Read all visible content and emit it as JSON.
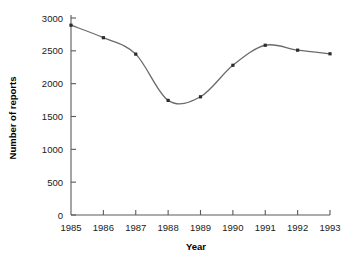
{
  "chart_data": {
    "type": "line",
    "title": "",
    "xlabel": "Year",
    "ylabel": "Number of reports",
    "categories": [
      "1985",
      "1986",
      "1987",
      "1988",
      "1989",
      "1990",
      "1991",
      "1992",
      "1993"
    ],
    "x": [
      1985,
      1986,
      1987,
      1988,
      1989,
      1990,
      1991,
      1992,
      1993
    ],
    "values": [
      2890,
      2700,
      2450,
      1745,
      1800,
      2280,
      2585,
      2510,
      2455
    ],
    "series": [
      {
        "name": "Number of reports",
        "values": [
          2890,
          2700,
          2450,
          1745,
          1800,
          2280,
          2585,
          2510,
          2455
        ]
      }
    ],
    "xlim": [
      1985,
      1993
    ],
    "ylim": [
      0,
      3000
    ],
    "ytick_labels": [
      "0",
      "500",
      "1000",
      "1500",
      "2000",
      "2500",
      "3000"
    ],
    "ytick_values": [
      0,
      500,
      1000,
      1500,
      2000,
      2500,
      3000
    ],
    "xtick_labels": [
      "1985",
      "1986",
      "1987",
      "1988",
      "1989",
      "1990",
      "1991",
      "1992",
      "1993"
    ],
    "grid": false,
    "legend": false,
    "legend_position": "none",
    "line_color": "#6b6b6b",
    "marker_color": "#2b2b2b",
    "marker_shape": "square",
    "smoothing": "spline",
    "background_color": "#ffffff",
    "axis_color": "#5a5a5a"
  }
}
